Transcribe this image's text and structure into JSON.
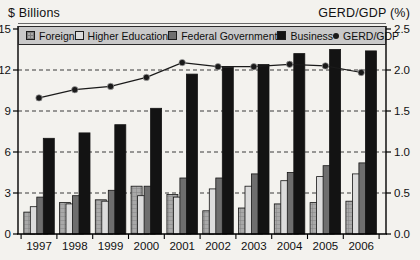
{
  "header": {
    "left_axis_title": "$ Billions",
    "right_axis_title": "GERD/GDP (%)"
  },
  "chart_data": {
    "type": "combo",
    "title": "",
    "categories": [
      "1997",
      "1998",
      "1999",
      "2000",
      "2001",
      "2002",
      "2003",
      "2004",
      "2005",
      "2006"
    ],
    "series": [
      {
        "name": "Foreign",
        "type": "bar",
        "color": "#a9a9a9",
        "pattern": "grid",
        "pattern_color": "#7e7e7e",
        "values": [
          1.6,
          2.3,
          2.5,
          3.5,
          2.9,
          1.7,
          1.9,
          2.2,
          2.3,
          2.4
        ]
      },
      {
        "name": "Higher Education",
        "type": "bar",
        "color": "#dcdcdc",
        "values": [
          2.0,
          2.2,
          2.4,
          2.8,
          2.7,
          3.3,
          3.5,
          3.9,
          4.2,
          4.4
        ]
      },
      {
        "name": "Federal Government",
        "type": "bar",
        "color": "#6e6e6e",
        "values": [
          2.7,
          2.8,
          3.2,
          3.5,
          4.1,
          4.1,
          4.4,
          4.5,
          5.0,
          5.2
        ]
      },
      {
        "name": "Business",
        "type": "bar",
        "color": "#131313",
        "values": [
          7.0,
          7.4,
          8.0,
          9.2,
          11.7,
          12.2,
          12.4,
          13.2,
          13.5,
          13.4
        ]
      },
      {
        "name": "GERD/GDP",
        "type": "line",
        "axis": "right",
        "color": "#1a1a1a",
        "values": [
          1.66,
          1.76,
          1.8,
          1.91,
          2.09,
          2.04,
          2.04,
          2.07,
          2.05,
          1.97
        ]
      }
    ],
    "y_left": {
      "title": "$ Billions",
      "ticks": [
        0,
        3,
        6,
        9,
        12,
        15
      ],
      "range": [
        0,
        15
      ]
    },
    "y_right": {
      "title": "GERD/GDP (%)",
      "ticks": [
        "0.0",
        "0.5",
        "1.0",
        "1.5",
        "2.0",
        "2.5"
      ],
      "range": [
        0,
        2.5
      ]
    },
    "grid": "dashed horizontal at 3,6,9,12",
    "legend_position": "top",
    "colors": {
      "grid_line": "#3a3a3a",
      "frame": "#000000",
      "legend_bg": "#c9c9c9",
      "text": "#111111"
    }
  }
}
